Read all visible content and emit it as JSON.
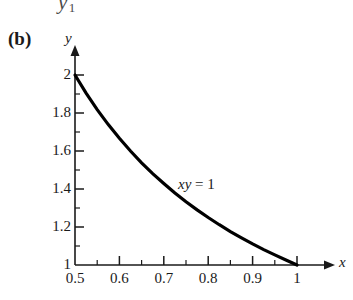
{
  "figure": {
    "panel_label": "(b)",
    "clipped_artifact_above": {
      "symbol": "y",
      "subscript": "1"
    },
    "background_color": "#ffffff",
    "ink_color": "#1a1a1a",
    "curve_color": "#000000"
  },
  "chart_data": {
    "type": "line",
    "title": "",
    "subtitle": "",
    "xlabel": "x",
    "ylabel": "y",
    "annotation": {
      "equation_italic": "xy",
      "equation_rest": " = 1",
      "full": "xy = 1"
    },
    "xlim": [
      0.5,
      1.0
    ],
    "ylim": [
      1.0,
      2.0
    ],
    "grid": false,
    "legend": "none",
    "xticks": [
      0.5,
      0.6,
      0.7,
      0.8,
      0.9,
      1
    ],
    "xtick_labels": [
      "0.5",
      "0.6",
      "0.7",
      "0.8",
      "0.9",
      "1"
    ],
    "yticks": [
      1,
      1.2,
      1.4,
      1.6,
      1.8,
      2
    ],
    "ytick_labels": [
      "1",
      "1.2",
      "1.4",
      "1.6",
      "1.8",
      "2"
    ],
    "x_minor_ticks": [
      0.55,
      0.65,
      0.75,
      0.85,
      0.95
    ],
    "y_minor_ticks": [
      1.1,
      1.3,
      1.5,
      1.7,
      1.9
    ],
    "series": [
      {
        "name": "xy = 1",
        "equation": "y = 1/x",
        "x": [
          0.5,
          0.525,
          0.55,
          0.575,
          0.6,
          0.625,
          0.65,
          0.675,
          0.7,
          0.725,
          0.75,
          0.775,
          0.8,
          0.825,
          0.85,
          0.875,
          0.9,
          0.925,
          0.95,
          0.975,
          1.0
        ],
        "values": [
          2.0,
          1.905,
          1.818,
          1.739,
          1.667,
          1.6,
          1.538,
          1.481,
          1.429,
          1.379,
          1.333,
          1.29,
          1.25,
          1.212,
          1.176,
          1.143,
          1.111,
          1.081,
          1.053,
          1.026,
          1.0
        ]
      }
    ]
  }
}
